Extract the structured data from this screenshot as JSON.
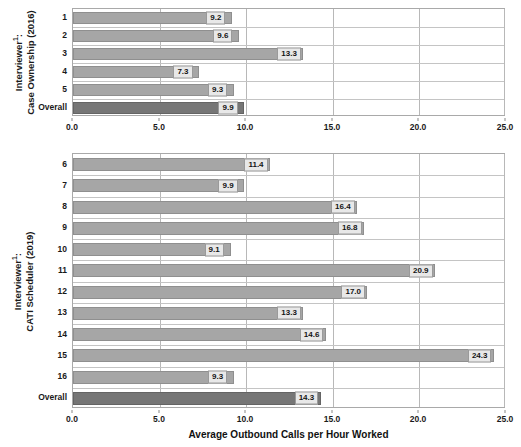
{
  "chart_data": [
    {
      "type": "bar",
      "orientation": "horizontal",
      "panel": "top",
      "title": "",
      "ylabel_line1": "Interviewer¹:",
      "ylabel_line2": "Case Ownership (2016)",
      "xlabel": "",
      "categories": [
        "1",
        "2",
        "3",
        "4",
        "5",
        "Overall"
      ],
      "values": [
        9.2,
        9.6,
        13.3,
        7.3,
        9.3,
        9.9
      ],
      "labels": [
        "9.2",
        "9.6",
        "13.3",
        "7.3",
        "9.3",
        "9.9"
      ],
      "highlight_category": "Overall",
      "xlim": [
        0.0,
        25.0
      ],
      "xticks": [
        0.0,
        5.0,
        10.0,
        15.0,
        20.0,
        25.0
      ],
      "xticklabels": [
        "0.0",
        "5.0",
        "10.0",
        "15.0",
        "20.0",
        "25.0"
      ],
      "grid": true,
      "legend": false,
      "bar_color": "#a6a6a6",
      "overall_bar_color": "#767676"
    },
    {
      "type": "bar",
      "orientation": "horizontal",
      "panel": "bottom",
      "title": "",
      "ylabel_line1": "Interviewer¹:",
      "ylabel_line2": "CATI Scheduler (2019)",
      "xlabel": "Average Outbound Calls per Hour Worked",
      "categories": [
        "6",
        "7",
        "8",
        "9",
        "10",
        "11",
        "12",
        "13",
        "14",
        "15",
        "16",
        "Overall"
      ],
      "values": [
        11.4,
        9.9,
        16.4,
        16.8,
        9.1,
        20.9,
        17.0,
        13.3,
        14.6,
        24.3,
        9.3,
        14.3
      ],
      "labels": [
        "11.4",
        "9.9",
        "16.4",
        "16.8",
        "9.1",
        "20.9",
        "17.0",
        "13.3",
        "14.6",
        "24.3",
        "9.3",
        "14.3"
      ],
      "highlight_category": "Overall",
      "xlim": [
        0.0,
        25.0
      ],
      "xticks": [
        0.0,
        5.0,
        10.0,
        15.0,
        20.0,
        25.0
      ],
      "xticklabels": [
        "0.0",
        "5.0",
        "10.0",
        "15.0",
        "20.0",
        "25.0"
      ],
      "grid": true,
      "legend": false,
      "bar_color": "#a6a6a6",
      "overall_bar_color": "#767676"
    }
  ],
  "xaxis_title": "Average Outbound Calls per Hour Worked"
}
